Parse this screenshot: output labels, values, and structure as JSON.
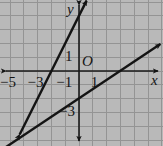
{
  "figure": {
    "kind": "coordinate-plane-graph",
    "background_color": "#b9b9b9",
    "grid_color": "#8f8f8f",
    "axis_color": "#1a1a1a",
    "line_color": "#141414",
    "width": 163,
    "height": 146
  },
  "axes": {
    "x_label": "x",
    "y_label": "y",
    "origin_label": "O",
    "origin_px": {
      "x": 79,
      "y": 71
    },
    "unit_px": 13.8,
    "x_tick_labels": [
      {
        "text": "−5",
        "value": -5
      },
      {
        "text": "−3",
        "value": -3
      },
      {
        "text": "−1",
        "value": -1
      },
      {
        "text": "1",
        "value": 1
      }
    ],
    "y_tick_labels": [
      {
        "text": "1",
        "value": 1
      },
      {
        "text": "−3",
        "value": -3
      }
    ],
    "x_range": [
      -6.0,
      6.0
    ],
    "y_range": [
      -5.3,
      5.1
    ],
    "grid": "on",
    "arrows": [
      "x-left",
      "x-right",
      "y-up",
      "y-down"
    ]
  },
  "chart_data": {
    "type": "line",
    "title": "",
    "xlabel": "x",
    "ylabel": "y",
    "xlim": [
      -6.0,
      6.0
    ],
    "ylim": [
      -5.3,
      5.1
    ],
    "grid": true,
    "legend": "none",
    "series": [
      {
        "name": "steep-line",
        "slope": 2,
        "intercept": 4,
        "x_intercept": -2,
        "points": [
          {
            "x": -4.3,
            "y": -4.6
          },
          {
            "x": 0.55,
            "y": 5.1
          }
        ],
        "arrow_ends": [
          "both"
        ]
      },
      {
        "name": "shallow-line",
        "slope": 0.6667,
        "intercept": -2,
        "x_intercept": 3,
        "points": [
          {
            "x": -5.8,
            "y": -5.85
          },
          {
            "x": 5.9,
            "y": 1.95
          }
        ],
        "arrow_ends": [
          "both"
        ]
      }
    ],
    "intersection": {
      "x": -3.0,
      "y": -4.0
    }
  }
}
